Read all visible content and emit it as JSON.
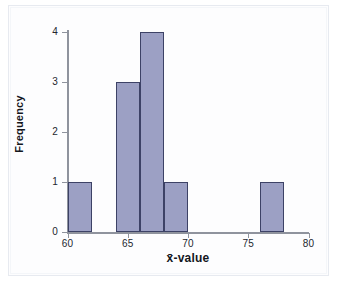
{
  "chart_data": {
    "type": "bar",
    "title": "",
    "subtitle": "",
    "xlabel": "x̄-value",
    "ylabel": "Frequency",
    "xlim": [
      60,
      80
    ],
    "ylim": [
      0,
      4
    ],
    "grid": false,
    "legend": null,
    "bin_width": 2,
    "x_ticks": [
      {
        "value": 60,
        "label": "60"
      },
      {
        "value": 65,
        "label": "65"
      },
      {
        "value": 70,
        "label": "70"
      },
      {
        "value": 75,
        "label": "75"
      },
      {
        "value": 80,
        "label": "80"
      }
    ],
    "y_ticks": [
      {
        "value": 0,
        "label": "0"
      },
      {
        "value": 1,
        "label": "1"
      },
      {
        "value": 2,
        "label": "2"
      },
      {
        "value": 3,
        "label": "3"
      },
      {
        "value": 4,
        "label": "4"
      }
    ],
    "bars": [
      {
        "bin_start": 60,
        "bin_end": 62,
        "frequency": 1
      },
      {
        "bin_start": 64,
        "bin_end": 66,
        "frequency": 3
      },
      {
        "bin_start": 66,
        "bin_end": 68,
        "frequency": 4
      },
      {
        "bin_start": 68,
        "bin_end": 70,
        "frequency": 1
      },
      {
        "bin_start": 76,
        "bin_end": 78,
        "frequency": 1
      }
    ],
    "categories": [
      "60-62",
      "62-64",
      "64-66",
      "66-68",
      "68-70",
      "70-72",
      "72-74",
      "74-76",
      "76-78",
      "78-80"
    ],
    "values": [
      1,
      0,
      3,
      4,
      1,
      0,
      0,
      0,
      1,
      0
    ],
    "colors": {
      "bar_fill": "#9ca0c4",
      "bar_stroke": "#3d4266",
      "axis": "#8f939d",
      "text": "#14171d",
      "background": "#ffffff",
      "frame": "#e7eaf0"
    }
  }
}
